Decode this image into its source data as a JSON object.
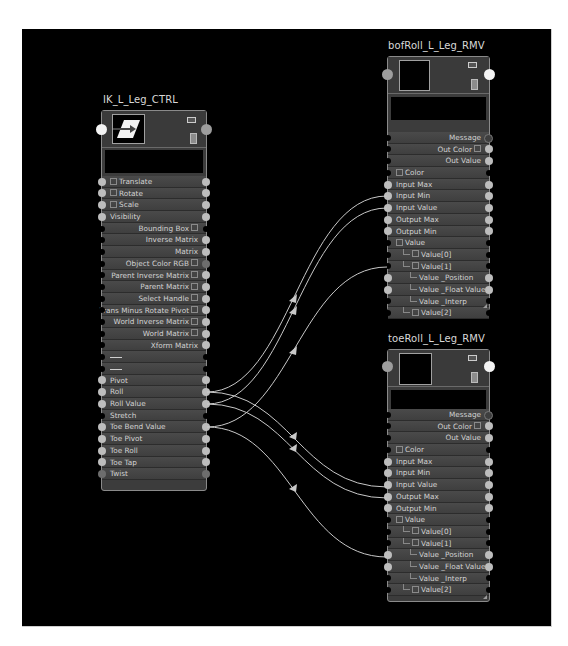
{
  "canvas": {
    "background": "#000000"
  },
  "nodes": {
    "ik": {
      "title": "IK_L_Leg_CTRL",
      "rows": [
        {
          "label": "Translate",
          "align": "left",
          "expand": true,
          "in": true,
          "out": true
        },
        {
          "label": "Rotate",
          "align": "left",
          "expand": true,
          "in": true,
          "out": true
        },
        {
          "label": "Scale",
          "align": "left",
          "expand": true,
          "in": true,
          "out": true
        },
        {
          "label": "Visibility",
          "align": "left",
          "expand": false,
          "in": true,
          "out": true
        },
        {
          "label": "Bounding Box",
          "align": "right",
          "compound": true,
          "in": false,
          "out": false
        },
        {
          "label": "Inverse Matrix",
          "align": "right",
          "in": false,
          "out": true
        },
        {
          "label": "Matrix",
          "align": "right",
          "in": false,
          "out": true
        },
        {
          "label": "Object Color RGB",
          "align": "right",
          "compound": true,
          "in": false,
          "out": "dark"
        },
        {
          "label": "Parent Inverse Matrix",
          "align": "right",
          "compound": true,
          "in": false,
          "out": true
        },
        {
          "label": "Parent Matrix",
          "align": "right",
          "compound": true,
          "in": false,
          "out": true
        },
        {
          "label": "Select Handle",
          "align": "right",
          "compound": true,
          "in": false,
          "out": true
        },
        {
          "label": "Trans Minus Rotate Pivot",
          "align": "right",
          "compound": true,
          "in": false,
          "out": true
        },
        {
          "label": "World Inverse Matrix",
          "align": "right",
          "compound": true,
          "in": false,
          "out": true
        },
        {
          "label": "World Matrix",
          "align": "right",
          "compound": true,
          "in": false,
          "out": true
        },
        {
          "label": "Xform Matrix",
          "align": "right",
          "in": false,
          "out": true
        },
        {
          "label": "",
          "align": "left",
          "separator": true,
          "in": false,
          "out": false
        },
        {
          "label": "",
          "align": "left",
          "separator": true,
          "in": false,
          "out": false
        },
        {
          "label": "Pivot",
          "align": "left",
          "in": true,
          "out": true
        },
        {
          "label": "Roll",
          "align": "left",
          "in": true,
          "out": true
        },
        {
          "label": "Roll Value",
          "align": "left",
          "in": true,
          "out": true
        },
        {
          "label": "Stretch",
          "align": "left",
          "in": false,
          "out": false
        },
        {
          "label": "Toe Bend Value",
          "align": "left",
          "in": true,
          "out": true
        },
        {
          "label": "Toe Pivot",
          "align": "left",
          "in": true,
          "out": true
        },
        {
          "label": "Toe Roll",
          "align": "left",
          "in": true,
          "out": true
        },
        {
          "label": "Toe Tap",
          "align": "left",
          "in": true,
          "out": true
        },
        {
          "label": "Twist",
          "align": "left",
          "in": "dark",
          "out": "dark"
        }
      ]
    },
    "bof": {
      "title": "bofRoll_L_Leg_RMV",
      "rows": [
        {
          "label": "Message",
          "align": "right",
          "in": false,
          "out": "darker"
        },
        {
          "label": "Out Color",
          "align": "right",
          "compound": true,
          "in": false,
          "out": true
        },
        {
          "label": "Out Value",
          "align": "right",
          "in": false,
          "out": true
        },
        {
          "label": "Color",
          "align": "left",
          "expand": true,
          "in": false,
          "out": false
        },
        {
          "label": "Input Max",
          "align": "left",
          "in": true,
          "out": true
        },
        {
          "label": "Input Min",
          "align": "left",
          "in": true,
          "out": true
        },
        {
          "label": "Input Value",
          "align": "left",
          "in": true,
          "out": true
        },
        {
          "label": "Output Max",
          "align": "left",
          "in": true,
          "out": true
        },
        {
          "label": "Output Min",
          "align": "left",
          "in": true,
          "out": true
        },
        {
          "label": "Value",
          "align": "left",
          "expand": true,
          "in": false,
          "out": false
        },
        {
          "label": "Value[0]",
          "align": "left",
          "depth": 1,
          "expand": true,
          "in": false,
          "out": false
        },
        {
          "label": "Value[1]",
          "align": "left",
          "depth": 1,
          "expand": true,
          "in": false,
          "out": false
        },
        {
          "label": "Value _Position",
          "align": "left",
          "depth": 2,
          "in": true,
          "out": true
        },
        {
          "label": "Value _Float Value",
          "align": "left",
          "depth": 2,
          "in": true,
          "out": true
        },
        {
          "label": "Value _Interp",
          "align": "left",
          "depth": 2,
          "in": false,
          "out": false
        },
        {
          "label": "Value[2]",
          "align": "left",
          "depth": 1,
          "expand": true,
          "in": false,
          "out": false
        }
      ]
    },
    "toe": {
      "title": "toeRoll_L_Leg_RMV",
      "rows": [
        {
          "label": "Message",
          "align": "right",
          "in": false,
          "out": "darker"
        },
        {
          "label": "Out Color",
          "align": "right",
          "compound": true,
          "in": false,
          "out": true
        },
        {
          "label": "Out Value",
          "align": "right",
          "in": false,
          "out": true
        },
        {
          "label": "Color",
          "align": "left",
          "expand": true,
          "in": false,
          "out": false
        },
        {
          "label": "Input Max",
          "align": "left",
          "in": true,
          "out": true
        },
        {
          "label": "Input Min",
          "align": "left",
          "in": true,
          "out": true
        },
        {
          "label": "Input Value",
          "align": "left",
          "in": true,
          "out": true
        },
        {
          "label": "Output Max",
          "align": "left",
          "in": true,
          "out": true
        },
        {
          "label": "Output Min",
          "align": "left",
          "in": true,
          "out": true
        },
        {
          "label": "Value",
          "align": "left",
          "expand": true,
          "in": false,
          "out": false
        },
        {
          "label": "Value[0]",
          "align": "left",
          "depth": 1,
          "expand": true,
          "in": false,
          "out": false
        },
        {
          "label": "Value[1]",
          "align": "left",
          "depth": 1,
          "expand": true,
          "in": false,
          "out": false
        },
        {
          "label": "Value _Position",
          "align": "left",
          "depth": 2,
          "in": true,
          "out": true
        },
        {
          "label": "Value _Float Value",
          "align": "left",
          "depth": 2,
          "in": true,
          "out": true
        },
        {
          "label": "Value _Interp",
          "align": "left",
          "depth": 2,
          "in": false,
          "out": false
        },
        {
          "label": "Value[2]",
          "align": "left",
          "depth": 1,
          "expand": true,
          "in": false,
          "out": false
        }
      ]
    }
  },
  "connections": [
    {
      "from": "IK_L_Leg_CTRL.Roll",
      "to": "bofRoll_L_Leg_RMV.Input Value"
    },
    {
      "from": "IK_L_Leg_CTRL.Roll Value",
      "to": "bofRoll_L_Leg_RMV.Output Max"
    },
    {
      "from": "IK_L_Leg_CTRL.Toe Bend Value",
      "to": "bofRoll_L_Leg_RMV.Value _Position"
    },
    {
      "from": "IK_L_Leg_CTRL.Roll",
      "to": "toeRoll_L_Leg_RMV.Input Value"
    },
    {
      "from": "IK_L_Leg_CTRL.Roll Value",
      "to": "toeRoll_L_Leg_RMV.Output Max"
    },
    {
      "from": "IK_L_Leg_CTRL.Toe Bend Value",
      "to": "toeRoll_L_Leg_RMV.Value _Position"
    }
  ],
  "colors": {
    "wire": "#c8c8c8",
    "port": "#bdbdbd",
    "node_bg": "#3c3c3c",
    "node_border": "#8a8a8a"
  }
}
